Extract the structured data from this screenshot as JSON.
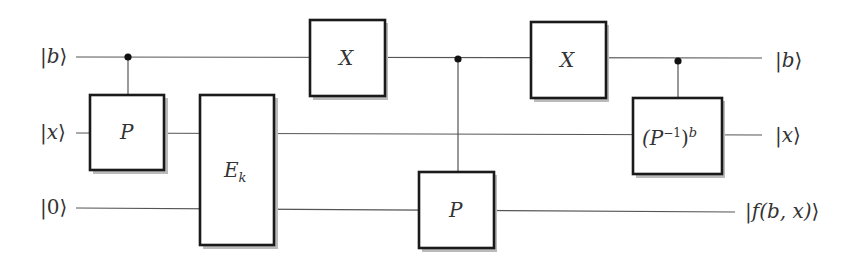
{
  "diagram": {
    "type": "quantum-circuit",
    "inputs": [
      {
        "label": "|b⟩",
        "open": "|",
        "var": "b",
        "close": "⟩"
      },
      {
        "label": "|x⟩",
        "open": "|",
        "var": "x",
        "close": "⟩"
      },
      {
        "label": "|0⟩",
        "open": "|",
        "var": "0",
        "close": "⟩"
      }
    ],
    "outputs": [
      {
        "label": "|b⟩",
        "open": "|",
        "var": "b",
        "close": "⟩"
      },
      {
        "label": "|x⟩",
        "open": "|",
        "var": "x",
        "close": "⟩"
      },
      {
        "label": "|f(b, x)⟩",
        "open": "|",
        "var": "f(b, x)",
        "close": "⟩"
      }
    ],
    "gates": [
      {
        "name": "P",
        "target_wire": "x",
        "control_wire": "b"
      },
      {
        "name": "E",
        "subscript": "k",
        "target_wires": [
          "x",
          "0"
        ]
      },
      {
        "name": "X",
        "target_wire": "b"
      },
      {
        "name": "P",
        "target_wire": "0",
        "control_wire": "b"
      },
      {
        "name": "X",
        "target_wire": "b"
      },
      {
        "name": "(P",
        "superscript_inner": "−1",
        "close": ")",
        "superscript_outer": "b",
        "target_wire": "x",
        "control_wire": "b",
        "full": "(P^{-1})^b"
      }
    ]
  }
}
